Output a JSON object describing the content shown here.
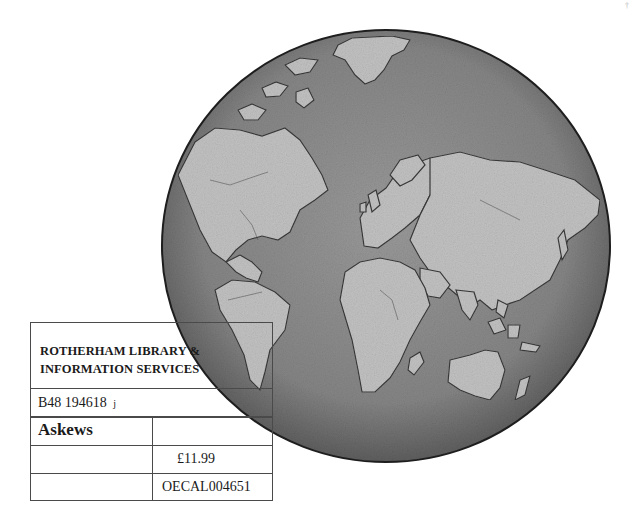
{
  "colors": {
    "background": "#ffffff",
    "globe_ocean": "#8c8c8c",
    "globe_land": "#bdbdbd",
    "globe_outline": "#1e1e1e",
    "label_border": "#4a4a4a",
    "label_text": "#1a1a1a"
  },
  "globe": {
    "description": "Grayscale globe illustration showing the Americas, Europe, Africa, Asia and Australia",
    "center_x": 386,
    "center_y": 246,
    "radius_x": 224,
    "radius_y": 216
  },
  "label": {
    "header_line_1": "ROTHERHAM LIBRARY &",
    "header_line_2": "INFORMATION SERVICES",
    "barcode": "B48 194618",
    "barcode_mark": "j",
    "supplier": "Askews",
    "supplier_value": "",
    "row3_left": "",
    "price": "£11.99",
    "row4_left": "",
    "reference": "OECAL004651"
  },
  "corner_mark": "†"
}
